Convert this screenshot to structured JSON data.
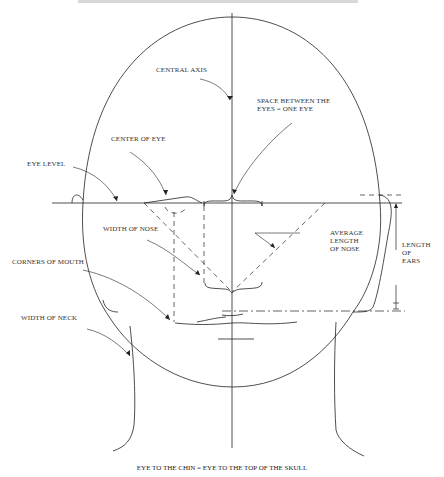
{
  "diagram": {
    "labels": {
      "central_axis": "CENTRAL AXIS",
      "space_between_eyes": "SPACE BETWEEN THE\nEYES = ONE EYE",
      "center_of_eye": "CENTER OF EYE",
      "eye_level": "EYE LEVEL",
      "width_of_nose": "WIDTH OF NOSE",
      "average_length_of_nose": "AVERAGE\nLENGTH\nOF NOSE",
      "length_of_ears": "LENGTH\nOF\nEARS",
      "corners_of_mouth": "CORNERS OF MOUTH",
      "width_of_neck": "WIDTH OF NECK"
    },
    "caption": "EYE TO THE CHIN = EYE TO THE TOP OF THE SKULL",
    "colors": {
      "line": "#222222",
      "text": "#333333",
      "background": "#ffffff"
    }
  }
}
